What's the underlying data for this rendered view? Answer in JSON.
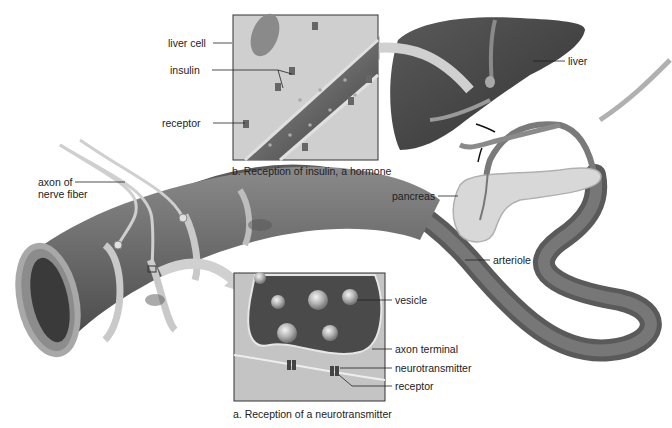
{
  "panel_b": {
    "caption": "b. Reception of insulin, a hormone",
    "labels": {
      "liver_cell": "liver cell",
      "insulin": "insulin",
      "receptor": "receptor"
    }
  },
  "panel_a": {
    "caption": "a. Reception of a neurotransmitter",
    "labels": {
      "vesicle": "vesicle",
      "axon_terminal": "axon terminal",
      "neurotransmitter": "neurotransmitter",
      "receptor": "receptor"
    }
  },
  "organs": {
    "liver": "liver",
    "pancreas": "pancreas",
    "arteriole": "arteriole",
    "axon": "axon of\nnerve fiber"
  },
  "colors": {
    "background": "#ffffff",
    "liver": "#4a4a4a",
    "vessel": "#6e6e6e",
    "panel_bg": "#c8c8c8",
    "label_text": "#222222"
  }
}
